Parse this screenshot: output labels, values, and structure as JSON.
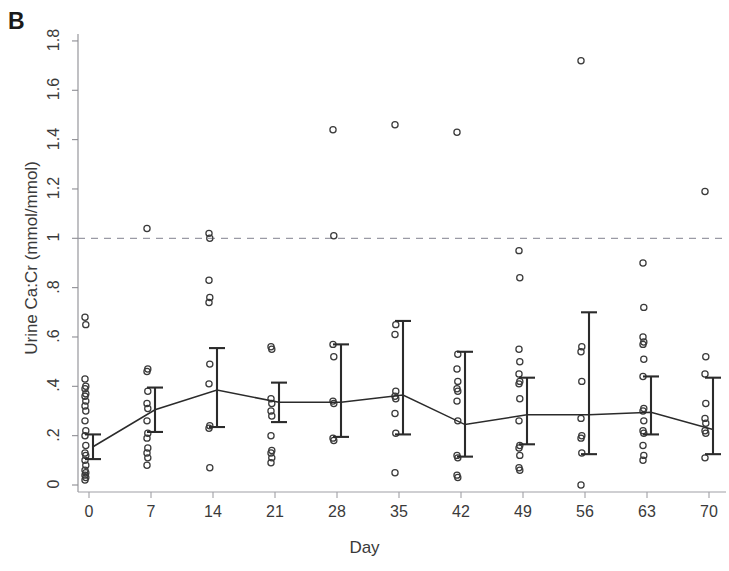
{
  "figure": {
    "panel_letter": "B",
    "ylabel": "Urine Ca:Cr (mmol/mmol)",
    "xlabel": "Day"
  },
  "chart_data": {
    "type": "scatter",
    "title": "",
    "xlabel": "Day",
    "ylabel": "Urine Ca:Cr (mmol/mmol)",
    "xlim": [
      -3,
      73
    ],
    "ylim": [
      0,
      1.85
    ],
    "xticks": [
      0,
      7,
      14,
      21,
      28,
      35,
      42,
      49,
      56,
      63,
      70
    ],
    "xtick_labels": [
      "0",
      "7",
      "14",
      "21",
      "28",
      "35",
      "42",
      "49",
      "56",
      "63",
      "70"
    ],
    "yticks": [
      0,
      0.2,
      0.4,
      0.6,
      0.8,
      1.0,
      1.2,
      1.4,
      1.6,
      1.8
    ],
    "ytick_labels": [
      "0",
      ".2",
      ".4",
      ".6",
      ".8",
      "1",
      "1.2",
      "1.4",
      "1.6",
      "1.8"
    ],
    "grid": false,
    "reference_line": {
      "y": 1.0,
      "style": "dashed",
      "color": "#9a9aa5",
      "label": ""
    },
    "marker": {
      "shape": "open-circle",
      "color": "#3a3a3a",
      "size": 6
    },
    "legend": null,
    "series": [
      {
        "name": "Individual urine Ca:Cr values",
        "type": "scatter",
        "points": [
          {
            "x": 0,
            "values": [
              0.68,
              0.65,
              0.43,
              0.4,
              0.39,
              0.37,
              0.36,
              0.34,
              0.32,
              0.3,
              0.26,
              0.22,
              0.2,
              0.16,
              0.13,
              0.12,
              0.1,
              0.08,
              0.06,
              0.05,
              0.04,
              0.03,
              0.02
            ]
          },
          {
            "x": 7,
            "values": [
              1.04,
              0.47,
              0.46,
              0.38,
              0.33,
              0.31,
              0.26,
              0.21,
              0.19,
              0.15,
              0.13,
              0.11,
              0.08
            ]
          },
          {
            "x": 14,
            "values": [
              1.02,
              1.0,
              0.83,
              0.76,
              0.74,
              0.49,
              0.41,
              0.24,
              0.23,
              0.07
            ]
          },
          {
            "x": 21,
            "values": [
              0.56,
              0.55,
              0.35,
              0.33,
              0.3,
              0.28,
              0.2,
              0.14,
              0.13,
              0.11,
              0.09
            ]
          },
          {
            "x": 28,
            "values": [
              1.44,
              1.01,
              0.57,
              0.52,
              0.34,
              0.33,
              0.19,
              0.18
            ]
          },
          {
            "x": 35,
            "values": [
              1.46,
              0.65,
              0.61,
              0.38,
              0.36,
              0.35,
              0.29,
              0.21,
              0.05
            ]
          },
          {
            "x": 42,
            "values": [
              1.43,
              0.53,
              0.47,
              0.42,
              0.39,
              0.38,
              0.34,
              0.26,
              0.12,
              0.11,
              0.04,
              0.03
            ]
          },
          {
            "x": 49,
            "values": [
              0.95,
              0.84,
              0.55,
              0.5,
              0.45,
              0.42,
              0.41,
              0.35,
              0.26,
              0.16,
              0.15,
              0.12,
              0.07,
              0.06
            ]
          },
          {
            "x": 56,
            "values": [
              1.72,
              0.56,
              0.54,
              0.42,
              0.27,
              0.2,
              0.19,
              0.13,
              0.0
            ]
          },
          {
            "x": 63,
            "values": [
              0.9,
              0.72,
              0.6,
              0.58,
              0.57,
              0.51,
              0.44,
              0.31,
              0.3,
              0.26,
              0.22,
              0.21,
              0.16,
              0.12,
              0.1
            ]
          },
          {
            "x": 70,
            "values": [
              1.19,
              0.52,
              0.45,
              0.33,
              0.27,
              0.25,
              0.22,
              0.21,
              0.11
            ]
          }
        ]
      },
      {
        "name": "Mean with 95% CI",
        "type": "line-errorbar",
        "color": "#2b2b2b",
        "x": [
          0,
          7,
          14,
          21,
          28,
          35,
          42,
          49,
          56,
          63,
          70
        ],
        "mean": [
          0.155,
          0.305,
          0.385,
          0.335,
          0.335,
          0.365,
          0.245,
          0.285,
          0.285,
          0.295,
          0.225
        ],
        "lower": [
          0.105,
          0.215,
          0.235,
          0.255,
          0.195,
          0.205,
          0.115,
          0.165,
          0.125,
          0.205,
          0.125
        ],
        "upper": [
          0.205,
          0.395,
          0.555,
          0.415,
          0.57,
          0.665,
          0.54,
          0.435,
          0.7,
          0.44,
          0.435
        ]
      }
    ]
  }
}
